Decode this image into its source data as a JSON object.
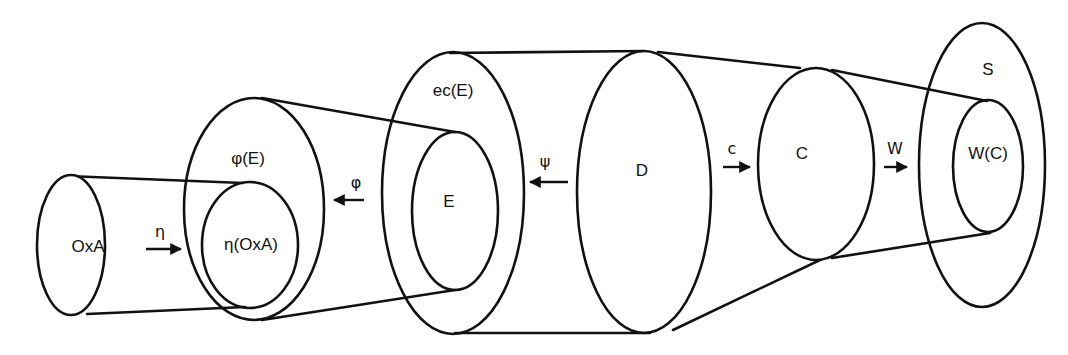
{
  "diagram": {
    "sets": [
      {
        "id": "oxa",
        "label": "OxA"
      },
      {
        "id": "eta_oxa",
        "label": "η(OxA)"
      },
      {
        "id": "phi_e",
        "label": "φ(E)"
      },
      {
        "id": "ec_e",
        "label": "ec(E)"
      },
      {
        "id": "e",
        "label": "E"
      },
      {
        "id": "d",
        "label": "D"
      },
      {
        "id": "c",
        "label": "C"
      },
      {
        "id": "s",
        "label": "S"
      },
      {
        "id": "w_c",
        "label": "W(C)"
      }
    ],
    "mappings": [
      {
        "id": "eta",
        "label": "η",
        "from": "OxA",
        "to": "η(OxA)",
        "direction": "right"
      },
      {
        "id": "phi",
        "label": "φ",
        "from": "E",
        "to": "φ(E)",
        "direction": "left"
      },
      {
        "id": "psi",
        "label": "ψ",
        "from": "D",
        "to": "ec(E)",
        "direction": "left"
      },
      {
        "id": "c",
        "label": "c",
        "from": "D",
        "to": "C",
        "direction": "right"
      },
      {
        "id": "w",
        "label": "W",
        "from": "C",
        "to": "W(C)",
        "direction": "right"
      }
    ],
    "stroke_color": "#111111",
    "background_color": "#ffffff"
  }
}
